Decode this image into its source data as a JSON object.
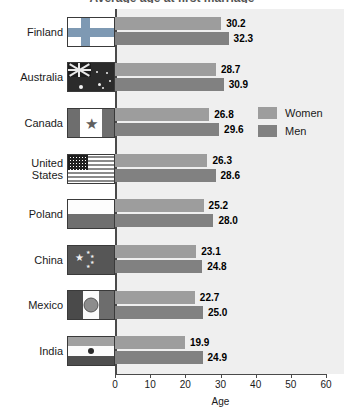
{
  "chart_data": {
    "type": "bar",
    "orientation": "horizontal",
    "title": "",
    "xlabel": "Age",
    "ylabel": "",
    "xlim": [
      0,
      60
    ],
    "xticks": [
      0,
      10,
      20,
      30,
      40,
      50,
      60
    ],
    "grid": false,
    "legend_position": "inside-upper-right",
    "categories": [
      "Finland",
      "Australia",
      "Canada",
      "United States",
      "Poland",
      "China",
      "Mexico",
      "India"
    ],
    "series": [
      {
        "name": "Women",
        "color": "#9d9d9d",
        "values": [
          30.2,
          28.7,
          26.8,
          26.3,
          25.2,
          23.1,
          22.7,
          19.9
        ]
      },
      {
        "name": "Men",
        "color": "#818181",
        "values": [
          32.3,
          30.9,
          29.6,
          28.6,
          28.0,
          24.8,
          25.0,
          24.9
        ]
      }
    ]
  },
  "title_sliver": "Average age at first marriage",
  "axis": {
    "x_title": "Age",
    "tick_labels": [
      "0",
      "10",
      "20",
      "30",
      "40",
      "50",
      "60"
    ]
  },
  "legend": {
    "items": [
      {
        "label": "Women",
        "swatch": "women-swatch"
      },
      {
        "label": "Men",
        "swatch": "men-swatch"
      }
    ]
  },
  "rows": [
    {
      "country": "Finland",
      "flag": "flag-finland",
      "women": "30.2",
      "men": "32.3"
    },
    {
      "country": "Australia",
      "flag": "flag-australia",
      "women": "28.7",
      "men": "30.9"
    },
    {
      "country": "Canada",
      "flag": "flag-canada",
      "women": "26.8",
      "men": "29.6"
    },
    {
      "country": "United\nStates",
      "flag": "flag-united-states",
      "women": "26.3",
      "men": "28.6"
    },
    {
      "country": "Poland",
      "flag": "flag-poland",
      "women": "25.2",
      "men": "28.0"
    },
    {
      "country": "China",
      "flag": "flag-china",
      "women": "23.1",
      "men": "24.8"
    },
    {
      "country": "Mexico",
      "flag": "flag-mexico",
      "women": "22.7",
      "men": "25.0"
    },
    {
      "country": "India",
      "flag": "flag-india",
      "women": "19.9",
      "men": "24.9"
    }
  ],
  "colors": {
    "women_bar": "#9d9d9d",
    "men_bar": "#818181",
    "plot_background": "#efefef",
    "axis": "#4a4a4a"
  }
}
